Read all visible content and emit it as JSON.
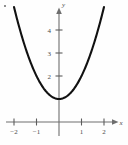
{
  "figure": {
    "corner_marker": "•"
  },
  "chart_data": {
    "type": "line",
    "title": "",
    "subtitle": "",
    "xlabel": "x",
    "ylabel": "y",
    "xlim": [
      -2.45,
      2.3
    ],
    "ylim": [
      -0.35,
      5.1
    ],
    "grid": false,
    "legend": null,
    "x_ticks": [
      -2,
      -1,
      1,
      2
    ],
    "x_tick_labels": [
      "−2",
      "−1",
      "1",
      "2"
    ],
    "y_ticks": [
      2,
      3,
      4
    ],
    "y_tick_labels": [
      "2",
      "3",
      "4"
    ],
    "series": [
      {
        "name": "y = x² + 1",
        "x": [
          -2.0,
          -1.75,
          -1.5,
          -1.25,
          -1.0,
          -0.75,
          -0.5,
          -0.25,
          0,
          0.25,
          0.5,
          0.75,
          1.0,
          1.25,
          1.5,
          1.75,
          2.0
        ],
        "values": [
          5.0,
          4.0625,
          3.25,
          2.5625,
          2.0,
          1.5625,
          1.25,
          1.0625,
          1.0,
          1.0625,
          1.25,
          1.5625,
          2.0,
          2.5625,
          3.25,
          4.0625,
          5.0
        ],
        "color": "#111111"
      }
    ],
    "vertex": [
      0,
      1
    ],
    "axis_arrows": true,
    "axis_color": "#6e6e6e"
  },
  "geometry": {
    "origin_px": [
      59,
      122
    ],
    "unit_x_px": 22.5,
    "unit_y_px": 23.0
  }
}
